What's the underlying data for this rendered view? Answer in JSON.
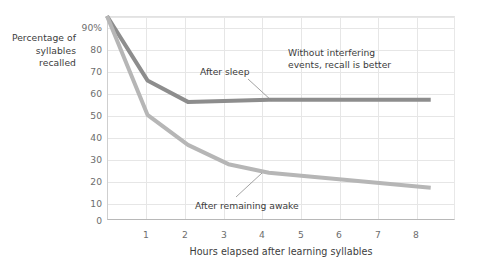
{
  "chart_data": {
    "type": "line",
    "title": "",
    "xlabel": "Hours elapsed after learning syllables",
    "ylabel": "Percentage of syllables recalled",
    "ylabel_lines": [
      "Percentage of",
      "syllables",
      "recalled"
    ],
    "xlim": [
      0,
      8.6
    ],
    "ylim": [
      0,
      95
    ],
    "grid": true,
    "legend_position": "none",
    "xticks": [
      1,
      2,
      3,
      4,
      5,
      6,
      7,
      8
    ],
    "xtick_labels": [
      "1",
      "2",
      "3",
      "4",
      "5",
      "6",
      "7",
      "8"
    ],
    "yticks": [
      0,
      10,
      20,
      30,
      40,
      50,
      60,
      70,
      80,
      90
    ],
    "ytick_labels": [
      "0",
      "10",
      "20",
      "30",
      "40",
      "50",
      "60",
      "70",
      "80",
      "90%"
    ],
    "series": [
      {
        "name": "After sleep",
        "color": "#8d8d8d",
        "x": [
          0,
          1,
          2,
          4,
          8
        ],
        "values": [
          95,
          65,
          55,
          56,
          56
        ]
      },
      {
        "name": "After remaining awake",
        "color": "#b6b6b6",
        "x": [
          0,
          1,
          2,
          3,
          4,
          8
        ],
        "values": [
          95,
          49,
          35,
          26,
          22,
          15
        ]
      }
    ],
    "annotations": [
      {
        "text": "After sleep",
        "target_x": 4.0,
        "target_y": 56
      },
      {
        "text": "Without interfering\nevents, recall is\nbetter",
        "target_x": null,
        "target_y": null
      },
      {
        "text": "After remaining awake",
        "target_x": 4.0,
        "target_y": 22
      }
    ]
  },
  "axis": {
    "ylabel_line1": "Percentage of",
    "ylabel_line2": "syllables",
    "ylabel_line3": "recalled",
    "xlabel": "Hours elapsed after learning syllables",
    "ytick_0": "0",
    "ytick_10": "10",
    "ytick_20": "20",
    "ytick_30": "30",
    "ytick_40": "40",
    "ytick_50": "50",
    "ytick_60": "60",
    "ytick_70": "70",
    "ytick_80": "80",
    "ytick_90": "90%",
    "xtick_1": "1",
    "xtick_2": "2",
    "xtick_3": "3",
    "xtick_4": "4",
    "xtick_5": "5",
    "xtick_6": "6",
    "xtick_7": "7",
    "xtick_8": "8"
  },
  "annotations": {
    "after_sleep": "After sleep",
    "without_interfering": "Without interfering events, recall is better",
    "after_awake": "After remaining awake"
  },
  "colors": {
    "line_after_sleep": "#8d8d8d",
    "line_after_awake": "#b6b6b6",
    "grid": "#e6e6e6",
    "axis": "#b8b8b8",
    "text": "#3c3c3c",
    "tick_text": "#6d6d6d"
  }
}
